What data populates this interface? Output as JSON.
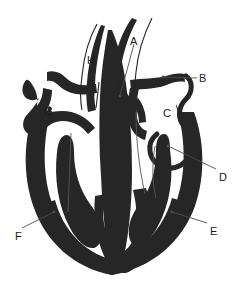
{
  "figure": {
    "type": "labeled-anatomy-diagram",
    "width": 244,
    "height": 293,
    "background_color": "#ffffff",
    "outline_color": "#262626",
    "fill_color": "#262626",
    "chamber_color": "#ffffff",
    "leader_line_color": "#4d4d4d",
    "label_text_color": "#1a1a1a"
  },
  "labels": [
    {
      "id": "A",
      "text": "A",
      "x": 130,
      "y": 36,
      "has_leader": true,
      "leader": {
        "x1": 134,
        "y1": 44,
        "x2": 120,
        "y2": 96
      },
      "region": "upper-center-right-vessel"
    },
    {
      "id": "B",
      "text": "B",
      "x": 199,
      "y": 73,
      "has_leader": true,
      "leader": {
        "x1": 197,
        "y1": 78,
        "x2": 163,
        "y2": 77
      },
      "region": "upper-right-vessel"
    },
    {
      "id": "C",
      "text": "C",
      "x": 163,
      "y": 108,
      "has_leader": false,
      "leader": null,
      "region": "right-upper-chamber"
    },
    {
      "id": "D",
      "text": "D",
      "x": 219,
      "y": 172,
      "has_leader": true,
      "leader": {
        "x1": 216,
        "y1": 169,
        "x2": 168,
        "y2": 146
      },
      "region": "right-valve"
    },
    {
      "id": "E",
      "text": "E",
      "x": 210,
      "y": 226,
      "has_leader": true,
      "leader": {
        "x1": 207,
        "y1": 223,
        "x2": 172,
        "y2": 212
      },
      "region": "right-thick-wall"
    },
    {
      "id": "F",
      "text": "F",
      "x": 15,
      "y": 231,
      "has_leader": true,
      "leader": {
        "x1": 22,
        "y1": 228,
        "x2": 54,
        "y2": 212
      },
      "region": "left-thick-wall"
    },
    {
      "id": "G",
      "text": "G",
      "x": 44,
      "y": 106,
      "has_leader": false,
      "leader": null,
      "region": "left-upper-chamber"
    },
    {
      "id": "H",
      "text": "H",
      "x": 87,
      "y": 55,
      "has_leader": false,
      "leader": null,
      "region": "upper-left-vessel"
    }
  ]
}
